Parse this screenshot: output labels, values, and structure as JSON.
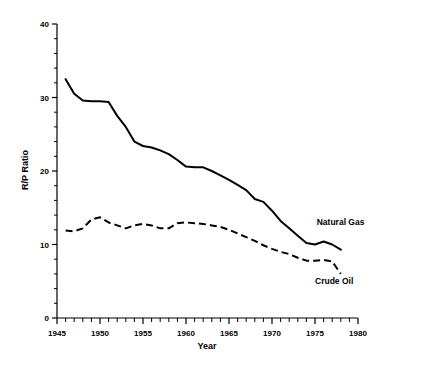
{
  "chart_data": {
    "type": "line",
    "title": "",
    "xlabel": "Year",
    "ylabel": "R/P Ratio",
    "xlim": [
      1945,
      1980
    ],
    "ylim": [
      0,
      40
    ],
    "grid": false,
    "legend_position": "inline-right",
    "x_ticks_major": [
      1945,
      1950,
      1955,
      1960,
      1965,
      1970,
      1975,
      1980
    ],
    "x_tick_labels": [
      "1945",
      "1950",
      "1955",
      "1960",
      "1965",
      "1970",
      "1975",
      "1980"
    ],
    "x_minor_step": 1,
    "y_ticks_major": [
      0,
      10,
      20,
      30,
      40
    ],
    "y_tick_labels": [
      "0",
      "10",
      "20",
      "30",
      "40"
    ],
    "y_minor_step": 2,
    "series": [
      {
        "name": "Natural Gas",
        "style": "solid",
        "color": "#000000",
        "x": [
          1946,
          1947,
          1948,
          1949,
          1950,
          1951,
          1952,
          1953,
          1954,
          1955,
          1956,
          1957,
          1958,
          1959,
          1960,
          1961,
          1962,
          1963,
          1964,
          1965,
          1966,
          1967,
          1968,
          1969,
          1970,
          1971,
          1972,
          1973,
          1974,
          1975,
          1976,
          1977,
          1978
        ],
        "y": [
          32.5,
          30.5,
          29.6,
          29.5,
          29.5,
          29.4,
          27.5,
          26.0,
          24.0,
          23.4,
          23.2,
          22.8,
          22.3,
          21.5,
          20.6,
          20.5,
          20.5,
          20.0,
          19.4,
          18.8,
          18.1,
          17.4,
          16.2,
          15.8,
          14.6,
          13.2,
          12.2,
          11.2,
          10.2,
          10.0,
          10.4,
          10.0,
          9.3
        ]
      },
      {
        "name": "Crude Oil",
        "style": "dashed",
        "color": "#000000",
        "x": [
          1946,
          1947,
          1948,
          1949,
          1950,
          1951,
          1952,
          1953,
          1954,
          1955,
          1956,
          1957,
          1958,
          1959,
          1960,
          1961,
          1962,
          1963,
          1964,
          1965,
          1966,
          1967,
          1968,
          1969,
          1970,
          1971,
          1972,
          1973,
          1974,
          1975,
          1976,
          1977,
          1978
        ],
        "y": [
          11.9,
          11.8,
          12.2,
          13.4,
          13.7,
          13.0,
          12.6,
          12.2,
          12.6,
          12.8,
          12.6,
          12.2,
          12.2,
          12.9,
          13.0,
          12.9,
          12.8,
          12.6,
          12.4,
          12.0,
          11.5,
          11.0,
          10.5,
          9.9,
          9.4,
          9.0,
          8.7,
          8.2,
          7.8,
          7.8,
          7.9,
          7.7,
          6.0
        ]
      }
    ],
    "annotations": [
      {
        "text": "Natural Gas",
        "x": 1975.2,
        "y": 12.7,
        "anchor": "start"
      },
      {
        "text": "Crude Oil",
        "x": 1975.0,
        "y": 4.6,
        "anchor": "start"
      }
    ]
  }
}
